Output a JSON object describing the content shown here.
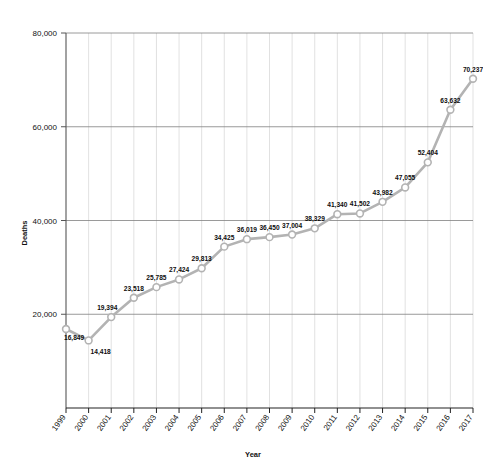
{
  "chart_data": {
    "type": "line",
    "title": "",
    "xlabel": "Year",
    "ylabel": "Deaths",
    "categories": [
      "1999",
      "2000",
      "2001",
      "2002",
      "2003",
      "2004",
      "2005",
      "2006",
      "2007",
      "2008",
      "2009",
      "2010",
      "2011",
      "2012",
      "2013",
      "2014",
      "2015",
      "2016",
      "2017"
    ],
    "values": [
      16849,
      14418,
      19394,
      23518,
      25785,
      27424,
      29813,
      34425,
      36019,
      36450,
      37004,
      38329,
      41340,
      41502,
      43982,
      47055,
      52404,
      63632,
      70237
    ],
    "point_labels": [
      "16,849",
      "14,418",
      "19,394",
      "23,518",
      "25,785",
      "27,424",
      "29,813",
      "34,425",
      "36,019",
      "36,450",
      "37,004",
      "38,329",
      "41,340",
      "41,502",
      "43,982",
      "47,055",
      "52,404",
      "63,632",
      "70,237"
    ],
    "ylim": [
      0,
      80000
    ],
    "yticks": [
      20000,
      40000,
      60000,
      80000
    ],
    "ytick_labels": [
      "20,000",
      "40,000",
      "60,000",
      "80,000"
    ],
    "grid": {
      "horizontal": true,
      "vertical": true
    },
    "legend": "none",
    "series_color": "#b3b3b3",
    "marker": "open-circle",
    "marker_fill": "#ffffff",
    "grid_color": "#d9d9d9",
    "axis_color": "#555555"
  }
}
